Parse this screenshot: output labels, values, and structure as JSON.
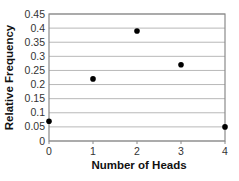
{
  "chart_data": {
    "type": "scatter",
    "title": "",
    "xlabel": "Number of Heads",
    "ylabel": "Relative Frequency",
    "x": [
      0,
      1,
      2,
      3,
      4
    ],
    "values": [
      0.07,
      0.22,
      0.39,
      0.27,
      0.05
    ],
    "series": [
      {
        "name": "Relative Frequency",
        "x": [
          0,
          1,
          2,
          3,
          4
        ],
        "values": [
          0.07,
          0.22,
          0.39,
          0.27,
          0.05
        ]
      }
    ],
    "xlim": [
      0,
      4
    ],
    "ylim": [
      0,
      0.45
    ],
    "x_ticks": [
      "0",
      "1",
      "2",
      "3",
      "4"
    ],
    "y_ticks": [
      "0",
      "0.05",
      "0.1",
      "0.15",
      "0.2",
      "0.25",
      "0.3",
      "0.35",
      "0.4",
      "0.45"
    ],
    "grid": "horizontal",
    "legend": "none",
    "colors": {
      "point": "#000000",
      "grid": "#b8b8b8",
      "axis": "#8a8a8a"
    }
  }
}
